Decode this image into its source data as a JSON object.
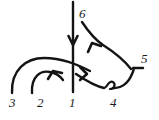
{
  "figure": {
    "type": "arc-diagram",
    "background_color": "#ffffff",
    "stroke_color": "#141414",
    "width": 159,
    "height": 120
  },
  "nodes": [
    {
      "id": "n1",
      "label": "1",
      "x": 69,
      "y": 103
    },
    {
      "id": "n2",
      "label": "2",
      "x": 37,
      "y": 103
    },
    {
      "id": "n3",
      "label": "3",
      "x": 9,
      "y": 103
    },
    {
      "id": "n4",
      "label": "4",
      "x": 110,
      "y": 103
    },
    {
      "id": "n5",
      "label": "5",
      "x": 141,
      "y": 58
    },
    {
      "id": "n6",
      "label": "6",
      "x": 79,
      "y": 8
    }
  ],
  "edges": [
    {
      "id": "e-vertical",
      "name": "vertical-line-6-to-1",
      "from": "6",
      "to": "1",
      "arrow": "down",
      "stroke_width": 2.4
    },
    {
      "id": "e-big-arc",
      "name": "arc-3-to-1",
      "from": "3",
      "to": "1",
      "arrow": "none",
      "stroke_width": 2.4
    },
    {
      "id": "e-small-arc",
      "name": "arc-2-to-1",
      "from": "2",
      "to": "1",
      "arrow": "up-left",
      "stroke_width": 2.4
    },
    {
      "id": "e-upper-right",
      "name": "arc-5-to-6-branch",
      "from": "5",
      "to": "6",
      "arrow": "up-left",
      "stroke_width": 2.4
    },
    {
      "id": "e-lower-right",
      "name": "arc-1-to-5-through-4",
      "from": "1",
      "to": "5",
      "arrow": "down-right",
      "stroke_width": 2.4,
      "has_loop_at": "4"
    }
  ],
  "annotations": {
    "loop": {
      "name": "loop-at-position-4",
      "at_node": "4",
      "x": 110,
      "y": 87
    }
  }
}
